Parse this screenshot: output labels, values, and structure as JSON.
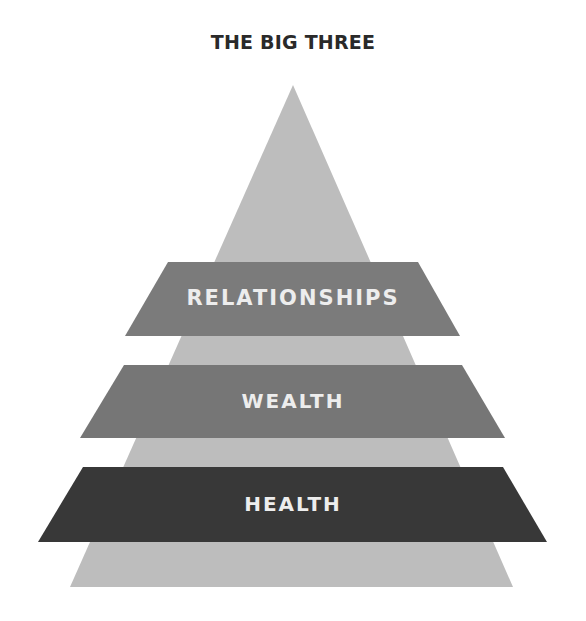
{
  "title": "THE BIG THREE",
  "colors": {
    "background": "#ffffff",
    "pyramid": "#bdbdbd",
    "band_relationships": "#7b7b7b",
    "band_wealth": "#767676",
    "band_health": "#383838",
    "band_text": "#ededed",
    "title_text": "#2a2a2a"
  },
  "pyramid": {
    "apex": [
      293,
      85
    ],
    "base_left": [
      70,
      587
    ],
    "base_right": [
      513,
      587
    ]
  },
  "bands": [
    {
      "id": "relationships",
      "label": "RELATIONSHIPS",
      "level": 1,
      "top": {
        "y": 262,
        "left": 168,
        "right": 418
      },
      "bottom": {
        "y": 336,
        "left": 125,
        "right": 460
      }
    },
    {
      "id": "wealth",
      "label": "WEALTH",
      "level": 2,
      "top": {
        "y": 365,
        "left": 124,
        "right": 462
      },
      "bottom": {
        "y": 438,
        "left": 80,
        "right": 505
      }
    },
    {
      "id": "health",
      "label": "HEALTH",
      "level": 3,
      "top": {
        "y": 467,
        "left": 83,
        "right": 503
      },
      "bottom": {
        "y": 542,
        "left": 38,
        "right": 547
      }
    }
  ]
}
